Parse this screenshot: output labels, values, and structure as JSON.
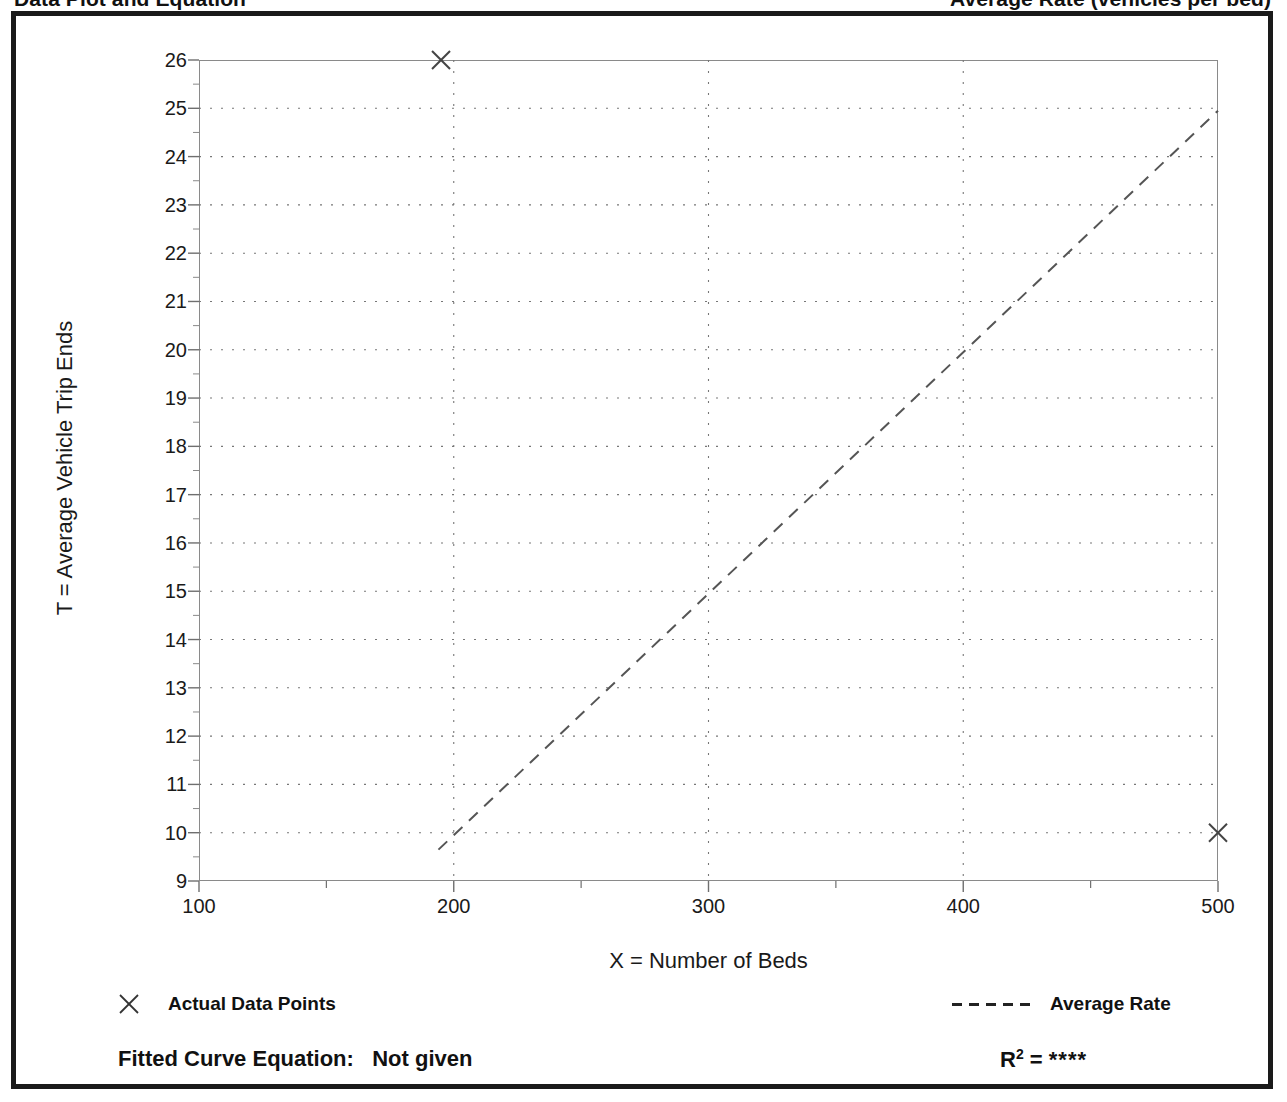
{
  "page_header": {
    "left_title": "Data Plot and Equation",
    "right_title": "Average Rate (vehicles per bed)"
  },
  "chart_data": {
    "type": "scatter",
    "title": "",
    "subtitle": "",
    "xlabel": "X = Number of Beds",
    "ylabel": "T = Average Vehicle Trip Ends",
    "xlim": [
      100,
      500
    ],
    "ylim": [
      9,
      26
    ],
    "xticks": [
      100,
      200,
      300,
      400,
      500
    ],
    "xtick_labels": [
      "100",
      "200",
      "300",
      "400",
      "500"
    ],
    "xminor_step": 50,
    "yticks": [
      9,
      10,
      11,
      12,
      13,
      14,
      15,
      16,
      17,
      18,
      19,
      20,
      21,
      22,
      23,
      24,
      25,
      26
    ],
    "ytick_labels": [
      "9",
      "10",
      "11",
      "12",
      "13",
      "14",
      "15",
      "16",
      "17",
      "18",
      "19",
      "20",
      "21",
      "22",
      "23",
      "24",
      "25",
      "26"
    ],
    "yminor_step": 0.5,
    "grid": true,
    "grid_style": "dotted",
    "legend_position": "below-plot",
    "series": [
      {
        "name": "Actual Data Points",
        "type": "scatter",
        "marker": "x",
        "points": [
          {
            "x": 195,
            "y": 26.0
          },
          {
            "x": 500,
            "y": 10.0
          }
        ]
      },
      {
        "name": "Average Rate",
        "type": "line",
        "style": "dashed",
        "points": [
          {
            "x": 194,
            "y": 9.65
          },
          {
            "x": 500,
            "y": 24.95
          }
        ]
      }
    ]
  },
  "legend": {
    "items": [
      {
        "label": "Actual Data Points",
        "marker": "x-marker"
      },
      {
        "label": "Average Rate",
        "marker": "dashed-line"
      }
    ]
  },
  "footer": {
    "equation_label": "Fitted Curve Equation:",
    "equation_value": "Not given",
    "r_squared_symbol": "R",
    "r_squared_exponent": "2",
    "r_squared_equals": "=",
    "r_squared_value": "****"
  },
  "colors": {
    "frame": "#1a1a1a",
    "axis": "#8a8a8a",
    "grid": "#777777",
    "data": "#555555",
    "text": "#111111"
  }
}
